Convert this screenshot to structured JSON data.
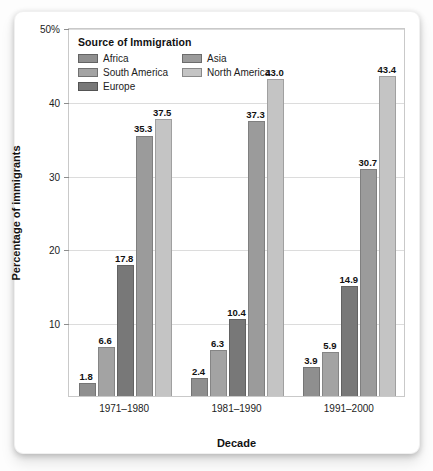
{
  "chart_data": {
    "type": "bar",
    "title": "",
    "xlabel": "Decade",
    "ylabel": "Percentage of immigrants",
    "ylim": [
      0,
      50
    ],
    "yticks": [
      10,
      20,
      30,
      40,
      50
    ],
    "ytick_labels": [
      "10",
      "20",
      "30",
      "40",
      "50%"
    ],
    "grid": true,
    "legend_title": "Source of Immigration",
    "legend_position": "inside-top-left",
    "categories": [
      "1971–1980",
      "1981–1990",
      "1991–2000"
    ],
    "series": [
      {
        "name": "Africa",
        "color": "#8f8f8f",
        "values": [
          1.8,
          2.4,
          3.9
        ]
      },
      {
        "name": "South America",
        "color": "#a3a3a3",
        "values": [
          6.6,
          6.3,
          5.9
        ]
      },
      {
        "name": "Europe",
        "color": "#787878",
        "values": [
          17.8,
          10.4,
          14.9
        ]
      },
      {
        "name": "Asia",
        "color": "#9b9b9b",
        "values": [
          35.3,
          37.3,
          30.7
        ]
      },
      {
        "name": "North America",
        "color": "#c4c4c4",
        "values": [
          37.5,
          43.0,
          43.4
        ]
      }
    ],
    "value_labels": [
      [
        "1.8",
        "6.6",
        "17.8",
        "35.3",
        "37.5"
      ],
      [
        "2.4",
        "6.3",
        "10.4",
        "37.3",
        "43.0"
      ],
      [
        "3.9",
        "5.9",
        "14.9",
        "30.7",
        "43.4"
      ]
    ]
  }
}
